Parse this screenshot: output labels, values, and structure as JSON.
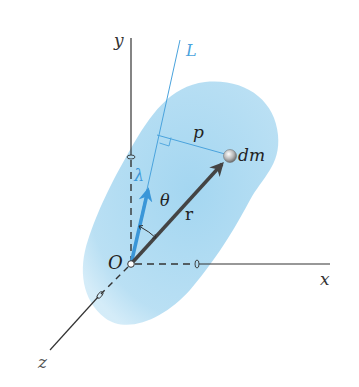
{
  "figure": {
    "colors": {
      "body_fill": "#a9d9f2",
      "axis_line": "#333333",
      "accent_blue": "#3a96d8",
      "line_L": "#4aa3dd",
      "vector_r": "#444444"
    },
    "labels": {
      "y_axis": "y",
      "x_axis": "x",
      "z_axis": "z",
      "origin": "O",
      "line_L": "L",
      "perpendicular": "p",
      "mass_element": "dm",
      "unit_vector": "λ",
      "angle": "θ",
      "position_vector": "r"
    }
  }
}
